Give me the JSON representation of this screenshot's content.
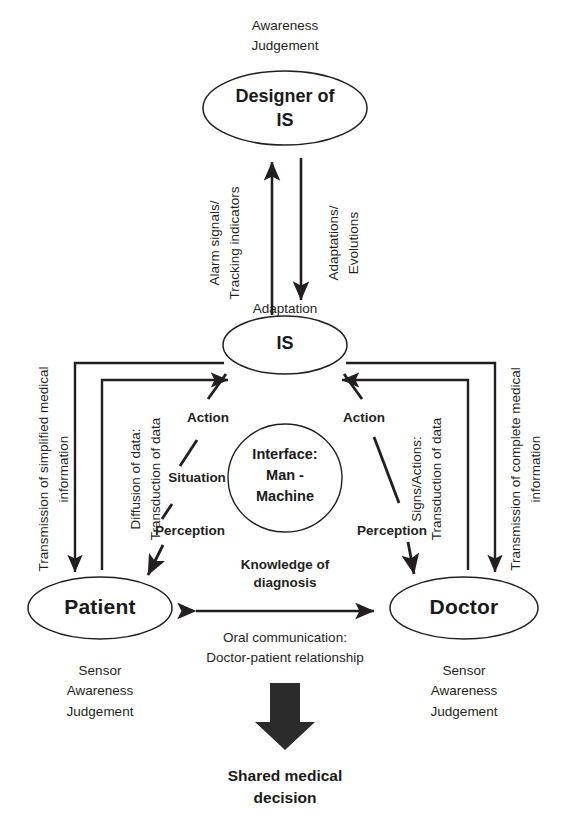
{
  "diagram": {
    "nodes": {
      "designer": "Designer of\nIS",
      "is": "IS",
      "interface": "Interface:\nMan -\nMachine",
      "patient": "Patient",
      "doctor": "Doctor"
    },
    "annotations": {
      "designer_top": "Awareness\nJudgement",
      "adaptation": "Adaptation",
      "alarm_signals": "Alarm signals/\nTracking indicators",
      "adaptations_evolutions": "Adaptations/\nEvolutions",
      "transmission_simplified": "Transmission of simplified medical\ninformation",
      "diffusion_of_data": "Diffusion of data:\nTransduction of data",
      "signs_actions": "Signs/Actions:\nTransduction of data",
      "transmission_complete": "Transmission of complete medical\ninformation",
      "action_left": "Action",
      "situation_left": "Situation",
      "perception_left": "Perception",
      "action_right": "Action",
      "perception_right": "Perception",
      "knowledge_of_diagnosis": "Knowledge of\ndiagnosis",
      "oral_communication": "Oral communication:\nDoctor-patient relationship",
      "patient_attributes": "Sensor\nAwareness\nJudgement",
      "doctor_attributes": "Sensor\nAwareness\nJudgement",
      "shared_decision": "Shared medical\ndecision"
    },
    "colors": {
      "stroke": "#231f20",
      "text": "#231f20",
      "background": "#ffffff",
      "block_arrow": "#2b2b2b"
    }
  }
}
